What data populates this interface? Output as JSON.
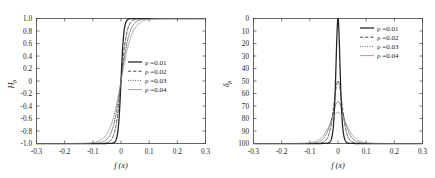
{
  "figure": {
    "panels": [
      {
        "id": "left",
        "ylabel": "H",
        "ylabel_sub": "ρ",
        "xlabel": "f (x)",
        "xticks": [
          "-0.3",
          "-0.2",
          "-0.1",
          "0",
          "0.1",
          "0.2",
          "0.3"
        ],
        "xtick_values": [
          -0.3,
          -0.2,
          -0.1,
          0,
          0.1,
          0.2,
          0.3
        ],
        "yticks": [
          "1.0",
          "0.8",
          "0.6",
          "0.4",
          "0.2",
          "0",
          "-0.2",
          "-0.4",
          "-0.6",
          "-0.8",
          "-1.0"
        ],
        "ytick_values": [
          1.0,
          0.8,
          0.6,
          0.4,
          0.2,
          0,
          -0.2,
          -0.4,
          -0.6,
          -0.8,
          -1.0
        ],
        "legend": [
          {
            "label": "ρ =0.01",
            "style": "solid",
            "color": "#222222",
            "width": 1.25
          },
          {
            "label": "ρ =0.02",
            "style": "dashed",
            "color": "#333333",
            "width": 0.9
          },
          {
            "label": "ρ =0.03",
            "style": "dotted",
            "color": "#444444",
            "width": 0.9
          },
          {
            "label": "ρ =0.04",
            "style": "solid",
            "color": "#8a8a8a",
            "width": 0.8
          }
        ]
      },
      {
        "id": "right",
        "ylabel": "δ",
        "ylabel_sub": "ρ",
        "xlabel": "f (x)",
        "xticks": [
          "-0.3",
          "-0.2",
          "-0.1",
          "0",
          "0.1",
          "0.2",
          "0.3"
        ],
        "xtick_values": [
          -0.3,
          -0.2,
          -0.1,
          0,
          0.1,
          0.2,
          0.3
        ],
        "yticks": [
          "100",
          "90",
          "80",
          "70",
          "60",
          "50",
          "40",
          "30",
          "20",
          "10",
          "0"
        ],
        "ytick_values": [
          100,
          90,
          80,
          70,
          60,
          50,
          40,
          30,
          20,
          10,
          0
        ],
        "legend": [
          {
            "label": "ρ =0.01",
            "style": "solid",
            "color": "#222222",
            "width": 1.25
          },
          {
            "label": "ρ =0.02",
            "style": "dashed",
            "color": "#333333",
            "width": 0.9
          },
          {
            "label": "ρ =0.03",
            "style": "dotted",
            "color": "#444444",
            "width": 0.9
          },
          {
            "label": "ρ =0.04",
            "style": "solid",
            "color": "#8a8a8a",
            "width": 0.8
          }
        ]
      }
    ]
  },
  "chart_data": [
    {
      "type": "line",
      "title": "",
      "panel": "left",
      "xlabel": "f (x)",
      "ylabel": "H_rho",
      "xlim": [
        -0.3,
        0.3
      ],
      "ylim": [
        -1.0,
        1.0
      ],
      "grid": false,
      "legend_position": "center-right",
      "xticks": [
        -0.3,
        -0.2,
        -0.1,
        0,
        0.1,
        0.2,
        0.3
      ],
      "yticks": [
        1.0,
        0.8,
        0.6,
        0.4,
        0.2,
        0,
        -0.2,
        -0.4,
        -0.6,
        -0.8,
        -1.0
      ],
      "function": "H_rho(x) = tanh(x / rho)",
      "x": [
        -0.3,
        -0.25,
        -0.2,
        -0.15,
        -0.12,
        -0.1,
        -0.08,
        -0.06,
        -0.05,
        -0.04,
        -0.03,
        -0.02,
        -0.015,
        -0.01,
        -0.005,
        0,
        0.005,
        0.01,
        0.015,
        0.02,
        0.03,
        0.04,
        0.05,
        0.06,
        0.08,
        0.1,
        0.12,
        0.15,
        0.2,
        0.25,
        0.3
      ],
      "series": [
        {
          "name": "ρ =0.01",
          "rho": 0.01,
          "style": "solid",
          "values": [
            -1.0,
            -1.0,
            -1.0,
            -1.0,
            -1.0,
            -1.0,
            -1.0,
            -0.99999,
            -0.99991,
            -0.99933,
            -0.99505,
            -0.96403,
            -0.90515,
            -0.76159,
            -0.46212,
            0,
            0.46212,
            0.76159,
            0.90515,
            0.96403,
            0.99505,
            0.99933,
            0.99991,
            0.99999,
            1.0,
            1.0,
            1.0,
            1.0,
            1.0,
            1.0,
            1.0
          ]
        },
        {
          "name": "ρ =0.02",
          "rho": 0.02,
          "style": "dashed",
          "values": [
            -1.0,
            -1.0,
            -1.0,
            -1.0,
            -0.99999,
            -0.99991,
            -0.99933,
            -0.99505,
            -0.98661,
            -0.96403,
            -0.90515,
            -0.76159,
            -0.63515,
            -0.46212,
            -0.24492,
            0,
            0.24492,
            0.46212,
            0.63515,
            0.76159,
            0.90515,
            0.96403,
            0.98661,
            0.99505,
            0.99933,
            0.99991,
            0.99999,
            1.0,
            1.0,
            1.0,
            1.0
          ]
        },
        {
          "name": "ρ =0.03",
          "rho": 0.03,
          "style": "dotted",
          "values": [
            -1.0,
            -1.0,
            -1.0,
            -0.99999,
            -0.99982,
            -0.99933,
            -0.99668,
            -0.96403,
            -0.99,
            -0.97,
            -0.76159,
            -0.58278,
            -0.46212,
            -0.32151,
            -0.16514,
            0,
            0.16514,
            0.32151,
            0.46212,
            0.58278,
            0.76159,
            0.86172,
            0.92167,
            0.96403,
            0.99317,
            0.99817,
            0.99951,
            0.99991,
            1.0,
            1.0,
            1.0
          ]
        },
        {
          "name": "ρ =0.04",
          "rho": 0.04,
          "style": "solid-gray",
          "values": [
            -1.0,
            -1.0,
            -0.99999,
            -0.99989,
            -0.99889,
            -0.98661,
            -0.96403,
            -0.90515,
            -0.84829,
            -0.76159,
            -0.63515,
            -0.46212,
            -0.34989,
            -0.24492,
            -0.12435,
            0,
            0.12435,
            0.24492,
            0.34989,
            0.46212,
            0.63515,
            0.76159,
            0.84829,
            0.90515,
            0.96403,
            0.98661,
            0.99505,
            0.99889,
            0.99999,
            1.0,
            1.0
          ]
        }
      ]
    },
    {
      "type": "line",
      "title": "",
      "panel": "right",
      "xlabel": "f (x)",
      "ylabel": "delta_rho",
      "xlim": [
        -0.3,
        0.3
      ],
      "ylim": [
        0,
        100
      ],
      "grid": false,
      "legend_position": "top-right",
      "xticks": [
        -0.3,
        -0.2,
        -0.1,
        0,
        0.1,
        0.2,
        0.3
      ],
      "yticks": [
        0,
        10,
        20,
        30,
        40,
        50,
        60,
        70,
        80,
        90,
        100
      ],
      "function": "delta_rho(x) = (1/rho) * sech^2(x / rho)",
      "peak_values": [
        100,
        50,
        33.3,
        25
      ],
      "x": [
        -0.3,
        -0.25,
        -0.2,
        -0.15,
        -0.12,
        -0.1,
        -0.08,
        -0.06,
        -0.05,
        -0.04,
        -0.03,
        -0.02,
        -0.015,
        -0.01,
        -0.005,
        0,
        0.005,
        0.01,
        0.015,
        0.02,
        0.03,
        0.04,
        0.05,
        0.06,
        0.08,
        0.1,
        0.12,
        0.15,
        0.2,
        0.25,
        0.3
      ],
      "series": [
        {
          "name": "ρ =0.01",
          "rho": 0.01,
          "style": "solid",
          "peak": 100,
          "values": [
            0,
            0,
            0,
            0,
            0,
            0,
            0,
            0.02,
            0.018,
            0.134,
            0.987,
            7.07,
            18.07,
            41.997,
            78.64,
            100,
            78.64,
            41.997,
            18.07,
            7.07,
            0.987,
            0.134,
            0.018,
            0.002,
            0,
            0,
            0,
            0,
            0,
            0,
            0
          ]
        },
        {
          "name": "ρ =0.02",
          "rho": 0.02,
          "style": "dashed",
          "peak": 50,
          "values": [
            0,
            0,
            0,
            0,
            0,
            0.009,
            0.067,
            0.493,
            1.34,
            3.535,
            9.035,
            20.998,
            29.83,
            39.32,
            47.0,
            50,
            47.0,
            39.32,
            29.83,
            20.998,
            9.035,
            3.535,
            1.34,
            0.493,
            0.067,
            0.009,
            0,
            0,
            0,
            0,
            0
          ]
        },
        {
          "name": "ρ =0.03",
          "rho": 0.03,
          "style": "dotted",
          "peak": 33.3,
          "values": [
            0,
            0,
            0,
            0.012,
            0.119,
            0.445,
            1.105,
            2.32,
            4.55,
            7.27,
            13.99,
            22.02,
            26.19,
            29.85,
            32.4,
            33.3,
            32.4,
            29.85,
            26.19,
            22.02,
            13.99,
            7.27,
            4.55,
            2.32,
            1.105,
            0.445,
            0.119,
            0.012,
            0,
            0,
            0
          ]
        },
        {
          "name": "ρ =0.04",
          "rho": 0.04,
          "style": "solid-gray",
          "peak": 25,
          "values": [
            0,
            0,
            0.006,
            0.056,
            0.248,
            0.665,
            1.766,
            4.5,
            7.07,
            11.29,
            15.0,
            19.66,
            21.94,
            23.5,
            24.6,
            25,
            24.6,
            23.5,
            21.94,
            19.66,
            15.0,
            11.29,
            7.07,
            4.5,
            1.766,
            0.665,
            0.248,
            0.056,
            0.006,
            0,
            0
          ]
        }
      ]
    }
  ]
}
